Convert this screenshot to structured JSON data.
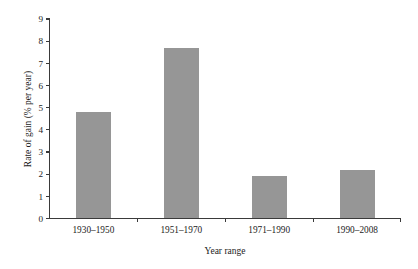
{
  "chart_data": {
    "type": "bar",
    "title": "",
    "subtitle": "",
    "xlabel": "Year range",
    "ylabel": "Rate of gain (% per year)",
    "categories": [
      "1930–1950",
      "1951–1970",
      "1971–1990",
      "1990–2008"
    ],
    "values": [
      4.8,
      7.7,
      1.9,
      2.2
    ],
    "ylim": [
      0,
      9
    ],
    "ytick_labels": [
      "0",
      "1",
      "2",
      "3",
      "4",
      "5",
      "6",
      "7",
      "8",
      "9"
    ],
    "ytick_values": [
      0,
      1,
      2,
      3,
      4,
      5,
      6,
      7,
      8,
      9
    ],
    "grid": false,
    "legend": false,
    "legend_position": "none",
    "bar_color": "#969696",
    "axis_color": "#3a3a3a",
    "text_color": "#1c1c1c",
    "background_color": "#ffffff"
  }
}
